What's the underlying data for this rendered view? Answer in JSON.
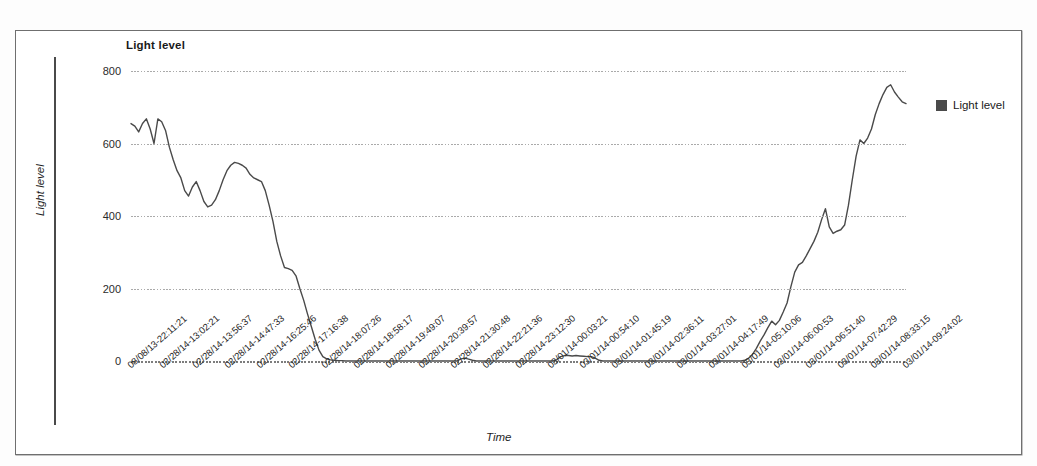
{
  "chart": {
    "title": "Light level",
    "xlabel": "Time",
    "ylabel": "Light level"
  },
  "legend": {
    "position": "right",
    "entries": [
      {
        "label": "Light level",
        "color": "#4a4a4a",
        "swatch": "filled-square-swatch"
      }
    ]
  },
  "yaxis": {
    "ticks": [
      "0",
      "200",
      "400",
      "600",
      "800"
    ]
  },
  "chart_data": {
    "type": "line",
    "title": "Light level",
    "xlabel": "Time",
    "ylabel": "Light level",
    "ylim": [
      0,
      800
    ],
    "yticks": [
      0,
      200,
      400,
      600,
      800
    ],
    "grid": true,
    "legend_position": "right",
    "tick_labels": [
      "08/08/13-22:11:21",
      "02/28/14-13:02:21",
      "02/28/14-13:56:37",
      "02/28/14-14:47:33",
      "02/28/14-16:25:46",
      "02/28/14-17:16:38",
      "02/28/14-18:07:26",
      "02/28/14-18:58:17",
      "02/28/14-19:49:07",
      "02/28/14-20:39:57",
      "02/28/14-21:30:48",
      "02/28/14-22:21:36",
      "02/28/14-23:12:30",
      "03/01/14-00:03:21",
      "03/01/14-00:54:10",
      "03/01/14-01:45:19",
      "03/01/14-02:36:11",
      "03/01/14-03:27:01",
      "03/01/14-04:17:49",
      "03/01/14-05:10:06",
      "03/01/14-06:00:53",
      "03/01/14-06:51:40",
      "03/01/14-07:42:29",
      "03/01/14-08:33:15",
      "03/01/14-09:24:02"
    ],
    "series": [
      {
        "name": "Light level",
        "color": "#4a4a4a",
        "values": [
          655,
          648,
          632,
          655,
          668,
          640,
          600,
          668,
          660,
          636,
          590,
          555,
          525,
          505,
          470,
          455,
          480,
          495,
          470,
          440,
          425,
          430,
          445,
          470,
          500,
          525,
          540,
          548,
          545,
          540,
          532,
          515,
          505,
          500,
          495,
          470,
          430,
          385,
          330,
          290,
          258,
          255,
          250,
          235,
          200,
          168,
          130,
          95,
          60,
          30,
          12,
          6,
          3,
          2,
          1,
          1,
          0,
          0,
          0,
          0,
          0,
          0,
          0,
          0,
          0,
          0,
          0,
          0,
          0,
          0,
          0,
          0,
          0,
          0,
          0,
          0,
          0,
          0,
          0,
          0,
          0,
          0,
          0,
          0,
          0,
          0,
          6,
          8,
          5,
          2,
          0,
          0,
          0,
          0,
          0,
          0,
          0,
          0,
          0,
          0,
          0,
          0,
          0,
          0,
          0,
          0,
          0,
          0,
          0,
          0,
          0,
          4,
          12,
          15,
          15,
          14,
          15,
          14,
          13,
          12,
          12,
          8,
          2,
          0,
          0,
          0,
          0,
          0,
          0,
          0,
          0,
          0,
          0,
          0,
          0,
          0,
          0,
          0,
          0,
          0,
          0,
          0,
          0,
          0,
          0,
          0,
          0,
          0,
          0,
          0,
          0,
          0,
          0,
          0,
          0,
          0,
          0,
          0,
          0,
          0,
          2,
          8,
          18,
          35,
          55,
          72,
          92,
          110,
          100,
          112,
          135,
          160,
          205,
          245,
          265,
          272,
          290,
          310,
          330,
          355,
          390,
          420,
          370,
          352,
          358,
          362,
          375,
          430,
          500,
          565,
          610,
          600,
          615,
          640,
          680,
          710,
          735,
          755,
          762,
          742,
          728,
          715,
          710
        ]
      }
    ]
  }
}
